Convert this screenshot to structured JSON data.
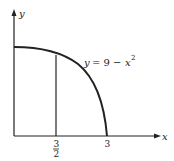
{
  "diagram": {
    "x_axis_label": "x",
    "y_axis_label": "y",
    "curve_label_lhs": "y",
    "curve_label_eq": "= 9 −",
    "curve_label_var": "x",
    "curve_label_exp": "2",
    "tick_half_num": "3",
    "tick_half_den": "2",
    "tick_three": "3",
    "curve_equation": "y = 9 - x^2",
    "colors": {
      "ink": "#222222",
      "background": "#ffffff"
    }
  }
}
